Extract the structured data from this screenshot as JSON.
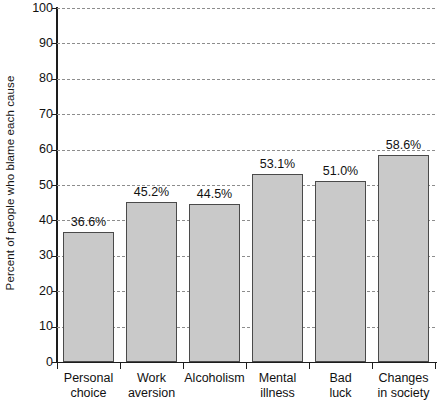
{
  "chart_data": {
    "type": "bar",
    "title": "",
    "subtitle": "",
    "xlabel": "",
    "ylabel": "Percent of people who blame each cause",
    "categories": [
      "Personal choice",
      "Work aversion",
      "Alcoholism",
      "Mental illness",
      "Bad luck",
      "Changes in society"
    ],
    "category_lines": [
      [
        "Personal",
        "choice"
      ],
      [
        "Work",
        "aversion"
      ],
      [
        "Alcoholism",
        ""
      ],
      [
        "Mental",
        "illness"
      ],
      [
        "Bad",
        "luck"
      ],
      [
        "Changes",
        "in society"
      ]
    ],
    "values": [
      36.6,
      45.2,
      44.5,
      53.1,
      51.0,
      58.6
    ],
    "value_labels": [
      "36.6%",
      "45.2%",
      "44.5%",
      "53.1%",
      "51.0%",
      "58.6%"
    ],
    "ylim": [
      0,
      100
    ],
    "ytick_labels": [
      "0",
      "10",
      "20",
      "30",
      "40",
      "50",
      "60",
      "70",
      "80",
      "90",
      "100"
    ],
    "ytick_values": [
      0,
      10,
      20,
      30,
      40,
      50,
      60,
      70,
      80,
      90,
      100
    ],
    "grid": true,
    "grid_style": "dashed",
    "legend": "none",
    "colors": {
      "bar_fill": "#c9c9c9",
      "bar_edge": "#4a4a4a",
      "axis": "#1d1d1d",
      "grid": "#8d8d8d",
      "text": "#111111",
      "background": "#ffffff"
    }
  }
}
